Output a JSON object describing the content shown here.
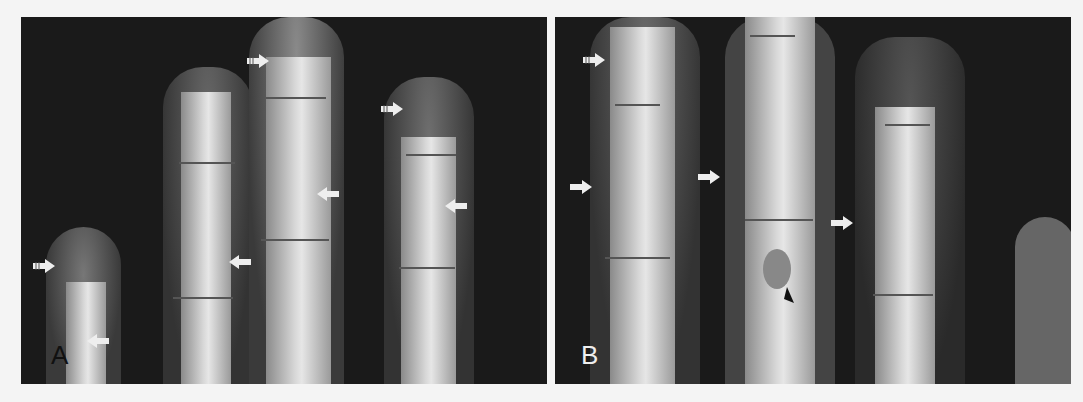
{
  "figure": {
    "panels": [
      {
        "id": "A",
        "label": "A",
        "description": "Radiograph of four fingers with arrows marking phalangeal lesions"
      },
      {
        "id": "B",
        "label": "B",
        "description": "Radiograph of fingers with arrows and an arrowhead marking lesions"
      }
    ],
    "annotations": {
      "panelA_feathered_arrows": 3,
      "panelA_plain_arrows": 4,
      "panelB_feathered_arrows": 1,
      "panelB_plain_arrows": 3,
      "panelB_arrowheads": 1
    }
  }
}
